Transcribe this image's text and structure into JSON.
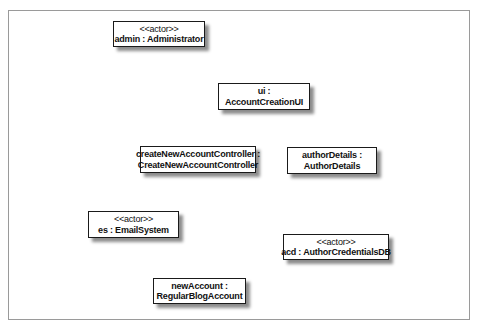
{
  "diagram": {
    "type": "uml-object-diagram",
    "objects": [
      {
        "id": "admin",
        "stereotype": "<<actor>>",
        "line1": "admin : Administrator",
        "line2": "",
        "box": [
          113,
          21,
          92,
          26
        ]
      },
      {
        "id": "ui",
        "stereotype": "",
        "line1": "ui :",
        "line2": "AccountCreationUI",
        "box": [
          218,
          83,
          92,
          27
        ]
      },
      {
        "id": "controller",
        "stereotype": "",
        "line1": "createNewAccountController :",
        "line2": "CreateNewAccountController",
        "box": [
          140,
          146,
          116,
          27
        ]
      },
      {
        "id": "authorDetails",
        "stereotype": "",
        "line1": "authorDetails :",
        "line2": "AuthorDetails",
        "box": [
          287,
          147,
          90,
          27
        ]
      },
      {
        "id": "es",
        "stereotype": "<<actor>>",
        "line1": "es : EmailSystem",
        "line2": "",
        "box": [
          88,
          211,
          91,
          27
        ]
      },
      {
        "id": "acd",
        "stereotype": "<<actor>>",
        "line1": "acd : AuthorCredentialsDB",
        "line2": "",
        "box": [
          283,
          234,
          106,
          26
        ]
      },
      {
        "id": "newAccount",
        "stereotype": "",
        "line1": "newAccount :",
        "line2": "RegularBlogAccount",
        "box": [
          153,
          278,
          93,
          26
        ]
      }
    ]
  }
}
